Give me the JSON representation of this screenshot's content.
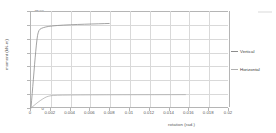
{
  "chart_data": {
    "type": "line",
    "title": "",
    "xlabel": "rotation (rad.)",
    "ylabel": "moment (kN-m)",
    "xlim": [
      0,
      0.02
    ],
    "ylim": [
      0,
      3500
    ],
    "xticks": [
      "0",
      "0.002",
      "0.004",
      "0.006",
      "0.008",
      "0.01",
      "0.012",
      "0.014",
      "0.016",
      "0.018",
      "0.02"
    ],
    "xtick_values": [
      0,
      0.002,
      0.004,
      0.006,
      0.008,
      0.01,
      0.012,
      0.014,
      0.016,
      0.018,
      0.02
    ],
    "yticks": [
      "0",
      "500",
      "1000",
      "1500",
      "2000",
      "2500",
      "3000",
      "3500"
    ],
    "ytick_values": [
      0,
      500,
      1000,
      1500,
      2000,
      2500,
      3000,
      3500
    ],
    "grid": true,
    "legend_position": "right",
    "series": [
      {
        "name": "Vertical",
        "color": "#8c8c8c",
        "points": [
          [
            0.0,
            0
          ],
          [
            6e-05,
            260
          ],
          [
            0.00012,
            520
          ],
          [
            0.00018,
            780
          ],
          [
            0.00024,
            1040
          ],
          [
            0.0003,
            1300
          ],
          [
            0.00036,
            1560
          ],
          [
            0.00042,
            1810
          ],
          [
            0.00048,
            2050
          ],
          [
            0.00054,
            2270
          ],
          [
            0.0006,
            2460
          ],
          [
            0.00066,
            2610
          ],
          [
            0.00072,
            2710
          ],
          [
            0.0008,
            2790
          ],
          [
            0.0009,
            2840
          ],
          [
            0.00105,
            2872
          ],
          [
            0.00125,
            2900
          ],
          [
            0.0015,
            2925
          ],
          [
            0.0018,
            2945
          ],
          [
            0.0022,
            2962
          ],
          [
            0.0027,
            2978
          ],
          [
            0.0033,
            2992
          ],
          [
            0.004,
            3004
          ],
          [
            0.0047,
            3014
          ],
          [
            0.0054,
            3023
          ],
          [
            0.0061,
            3031
          ],
          [
            0.0068,
            3038
          ],
          [
            0.0074,
            3045
          ],
          [
            0.0079,
            3050
          ]
        ]
      },
      {
        "name": "Horizontal",
        "color": "#b0b0b0",
        "points": [
          [
            0.0,
            0
          ],
          [
            0.0002,
            60
          ],
          [
            0.0004,
            120
          ],
          [
            0.0006,
            178
          ],
          [
            0.0008,
            232
          ],
          [
            0.001,
            283
          ],
          [
            0.0012,
            330
          ],
          [
            0.0014,
            372
          ],
          [
            0.0016,
            405
          ],
          [
            0.0018,
            428
          ],
          [
            0.002,
            443
          ],
          [
            0.0023,
            453
          ],
          [
            0.0027,
            460
          ],
          [
            0.0032,
            464
          ],
          [
            0.004,
            468
          ],
          [
            0.005,
            471
          ],
          [
            0.0062,
            474
          ],
          [
            0.0076,
            476
          ],
          [
            0.0092,
            478
          ],
          [
            0.0108,
            479
          ],
          [
            0.0125,
            480
          ],
          [
            0.0142,
            481
          ],
          [
            0.0156,
            482
          ]
        ]
      }
    ]
  },
  "legend": {
    "items": [
      {
        "label": "Vertical",
        "color": "#8c8c8c"
      },
      {
        "label": "Horizontal",
        "color": "#b0b0b0"
      }
    ]
  }
}
